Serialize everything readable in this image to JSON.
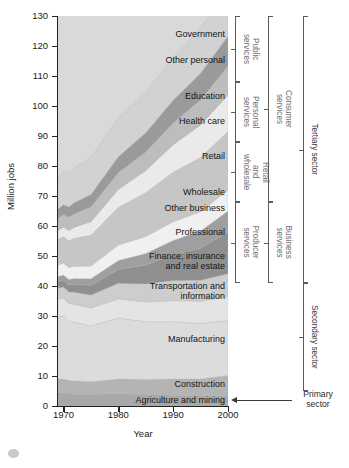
{
  "chart_data": {
    "type": "area",
    "title": "",
    "subtitle": "",
    "xlabel": "Year",
    "ylabel": "Million jobs",
    "xlim": [
      1969,
      2000
    ],
    "ylim": [
      0,
      130
    ],
    "xticks": [
      1970,
      1980,
      1990,
      2000
    ],
    "xtick_labels": [
      "1970",
      "1980",
      "1990",
      "2000"
    ],
    "yticks": [
      0,
      10,
      20,
      30,
      40,
      50,
      60,
      70,
      80,
      90,
      100,
      110,
      120,
      130
    ],
    "ytick_labels": [
      "0",
      "10",
      "20",
      "30",
      "40",
      "50",
      "60",
      "70",
      "80",
      "90",
      "100",
      "110",
      "120",
      "130"
    ],
    "grid": false,
    "legend_position": "inline-labels",
    "stacked": true,
    "x": [
      1969,
      1970,
      1971,
      1972,
      1975,
      1980,
      1985,
      1990,
      1995,
      2000
    ],
    "series": [
      {
        "name": "Agriculture and mining",
        "color": "#a8a8a8",
        "values": [
          4.4,
          4.4,
          4.1,
          3.8,
          3.9,
          4.2,
          3.8,
          3.6,
          3.5,
          3.4
        ]
      },
      {
        "name": "Construction",
        "color": "#b4b4b4",
        "values": [
          4.6,
          4.6,
          4.5,
          4.6,
          4.2,
          4.8,
          5.0,
          5.4,
          5.5,
          6.8
        ]
      },
      {
        "name": "Manufacturing",
        "color": "#dcdcdc",
        "values": [
          20.8,
          21.0,
          19.6,
          19.5,
          18.6,
          20.3,
          19.3,
          19.1,
          18.5,
          18.3
        ]
      },
      {
        "name": "Transportation and information",
        "color": "#e4e4e4",
        "values": [
          5.9,
          6.0,
          6.0,
          6.0,
          6.0,
          6.4,
          6.6,
          7.0,
          7.4,
          8.0
        ]
      },
      {
        "name": "Finance, insurance and real estate",
        "color": "#cdcdcd",
        "values": [
          3.6,
          3.7,
          3.8,
          4.0,
          4.3,
          5.2,
          6.0,
          6.7,
          7.0,
          7.6
        ]
      },
      {
        "name": "Professional",
        "color": "#8f8f8f",
        "values": [
          2.2,
          2.3,
          2.4,
          2.7,
          3.2,
          4.6,
          6.3,
          8.6,
          10.7,
          13.9
        ]
      },
      {
        "name": "Other business",
        "color": "#9f9f9f",
        "values": [
          1.6,
          1.7,
          1.8,
          1.9,
          2.2,
          3.0,
          3.8,
          4.8,
          5.7,
          7.0
        ]
      },
      {
        "name": "Wholesale",
        "color": "#f0f0f0",
        "values": [
          3.9,
          4.0,
          4.0,
          4.1,
          4.3,
          5.2,
          5.7,
          6.2,
          6.5,
          7.0
        ]
      },
      {
        "name": "Retail",
        "color": "#c6c6c6",
        "values": [
          8.5,
          8.7,
          8.9,
          9.3,
          10.2,
          12.5,
          14.6,
          16.5,
          18.0,
          19.5
        ]
      },
      {
        "name": "Health care",
        "color": "#eaeaea",
        "values": [
          3.0,
          3.2,
          3.4,
          3.7,
          4.5,
          6.0,
          7.4,
          9.2,
          10.9,
          12.2
        ]
      },
      {
        "name": "Education",
        "color": "#bdbdbd",
        "values": [
          4.0,
          4.2,
          4.4,
          4.5,
          4.9,
          5.6,
          6.2,
          7.2,
          8.4,
          9.6
        ]
      },
      {
        "name": "Other personal",
        "color": "#9a9a9a",
        "values": [
          3.2,
          3.3,
          3.5,
          3.7,
          4.2,
          5.3,
          6.4,
          7.6,
          8.8,
          10.0
        ]
      },
      {
        "name": "Government",
        "color": "#d2d2d2",
        "values": [
          10.8,
          11.0,
          11.3,
          11.6,
          12.3,
          13.0,
          13.5,
          14.3,
          15.0,
          16.0
        ]
      }
    ],
    "band_labels": [
      {
        "name": "Government",
        "value": 124.0
      },
      {
        "name": "Other personal",
        "value": 115.5
      },
      {
        "name": "Education",
        "value": 103.5
      },
      {
        "name": "Health care",
        "value": 95.0
      },
      {
        "name": "Retail",
        "value": 83.5
      },
      {
        "name": "Wholesale",
        "value": 71.5
      },
      {
        "name": "Other business",
        "value": 66.0
      },
      {
        "name": "Professional",
        "value": 58.0
      },
      {
        "name": "Finance, insurance\nand real estate",
        "value": 48.5
      },
      {
        "name": "Transportation and\ninformation",
        "value": 38.5
      },
      {
        "name": "Manufacturing",
        "value": 22.5
      },
      {
        "name": "Construction",
        "value": 7.5
      },
      {
        "name": "Agriculture and mining",
        "value": 2.0
      }
    ],
    "brackets": [
      {
        "label": "Public\nservices",
        "level": 1,
        "from": 108.0,
        "to": 130.0
      },
      {
        "label": "Personal\nservices",
        "level": 1,
        "from": 88.0,
        "to": 108.0
      },
      {
        "label": "Retail\nand\nwholesale",
        "level": 1,
        "from": 68.0,
        "to": 88.0
      },
      {
        "label": "Producer\nservices",
        "level": 1,
        "from": 41.0,
        "to": 68.0
      },
      {
        "label": "Consumer\nservices",
        "level": 2,
        "from": 68.0,
        "to": 130.0
      },
      {
        "label": "Business\nservices",
        "level": 2,
        "from": 41.0,
        "to": 68.0
      },
      {
        "label": "Tertiary sector",
        "level": 3,
        "from": 41.0,
        "to": 130.0
      },
      {
        "label": "Secondary sector",
        "level": 3,
        "from": 5.0,
        "to": 41.0
      }
    ],
    "annotations": [
      {
        "name": "Primary\nsector",
        "target_value": 2.0,
        "kind": "arrow"
      }
    ]
  }
}
